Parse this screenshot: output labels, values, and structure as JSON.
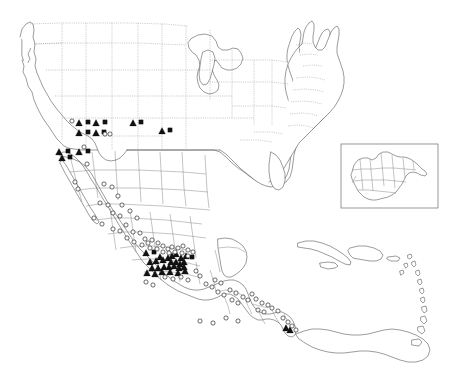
{
  "figure": {
    "kind": "distribution-map",
    "title": "",
    "projection_region": "North America, Mexico, Central America and the Caribbean",
    "background_color": "#ffffff",
    "coastline_color": "#4a4a4a",
    "internal_border_color": "#8d8d8d",
    "marker_fill_color": "#111111",
    "marker_open_color": "#ffffff"
  },
  "legend": {
    "visible": false,
    "entries": [
      {
        "symbol": "filled-triangle",
        "label": ""
      },
      {
        "symbol": "open-circle",
        "label": ""
      },
      {
        "symbol": "filled-square",
        "label": ""
      }
    ]
  },
  "inset": {
    "name": "guatemala-inset",
    "label": "",
    "frame": {
      "x": 341,
      "y": 144,
      "width": 97,
      "height": 64
    }
  },
  "chart_data": {
    "type": "scatter",
    "title": "",
    "xlabel": "",
    "ylabel": "",
    "grid": false,
    "legend_position": "none",
    "series": [
      {
        "name": "filled-triangle",
        "symbol": "filled-triangle",
        "count": 40,
        "points": [
          [
            79,
            123
          ],
          [
            96,
            123
          ],
          [
            133,
            123
          ],
          [
            79,
            133
          ],
          [
            96,
            133
          ],
          [
            162,
            131
          ],
          [
            59,
            152
          ],
          [
            79,
            152
          ],
          [
            62,
            158
          ],
          [
            146,
            253
          ],
          [
            160,
            257
          ],
          [
            150,
            262
          ],
          [
            156,
            261
          ],
          [
            163,
            260
          ],
          [
            168,
            258
          ],
          [
            172,
            256
          ],
          [
            176,
            254
          ],
          [
            171,
            262
          ],
          [
            176,
            262
          ],
          [
            181,
            258
          ],
          [
            180,
            264
          ],
          [
            184,
            262
          ],
          [
            186,
            256
          ],
          [
            152,
            268
          ],
          [
            158,
            268
          ],
          [
            164,
            267
          ],
          [
            169,
            267
          ],
          [
            174,
            266
          ],
          [
            179,
            268
          ],
          [
            184,
            267
          ],
          [
            147,
            273
          ],
          [
            155,
            274
          ],
          [
            162,
            272
          ],
          [
            170,
            272
          ],
          [
            178,
            273
          ],
          [
            185,
            271
          ],
          [
            286,
            328
          ],
          [
            290,
            330
          ],
          [
            358,
            188
          ],
          [
            371,
            188
          ]
        ]
      },
      {
        "name": "filled-square",
        "symbol": "filled-square",
        "count": 12,
        "points": [
          [
            88,
            122
          ],
          [
            105,
            122
          ],
          [
            141,
            122
          ],
          [
            88,
            132
          ],
          [
            104,
            132
          ],
          [
            170,
            130
          ],
          [
            68,
            151
          ],
          [
            88,
            151
          ],
          [
            70,
            157
          ],
          [
            154,
            252
          ],
          [
            192,
            257
          ],
          [
            377,
            187
          ]
        ]
      },
      {
        "name": "open-circle",
        "symbol": "open-circle",
        "count": 86,
        "points": [
          [
            72,
            121
          ],
          [
            105,
            134
          ],
          [
            110,
            134
          ],
          [
            84,
            147
          ],
          [
            87,
            164
          ],
          [
            75,
            182
          ],
          [
            78,
            189
          ],
          [
            104,
            184
          ],
          [
            112,
            187
          ],
          [
            118,
            196
          ],
          [
            100,
            203
          ],
          [
            108,
            205
          ],
          [
            122,
            205
          ],
          [
            113,
            213
          ],
          [
            120,
            216
          ],
          [
            130,
            211
          ],
          [
            137,
            218
          ],
          [
            94,
            218
          ],
          [
            102,
            224
          ],
          [
            113,
            229
          ],
          [
            120,
            231
          ],
          [
            126,
            225
          ],
          [
            133,
            232
          ],
          [
            127,
            238
          ],
          [
            134,
            242
          ],
          [
            140,
            233
          ],
          [
            145,
            239
          ],
          [
            142,
            245
          ],
          [
            148,
            243
          ],
          [
            152,
            240
          ],
          [
            158,
            243
          ],
          [
            150,
            248
          ],
          [
            157,
            249
          ],
          [
            163,
            246
          ],
          [
            168,
            249
          ],
          [
            172,
            247
          ],
          [
            178,
            248
          ],
          [
            183,
            246
          ],
          [
            188,
            250
          ],
          [
            163,
            252
          ],
          [
            169,
            253
          ],
          [
            175,
            252
          ],
          [
            182,
            253
          ],
          [
            188,
            256
          ],
          [
            193,
            252
          ],
          [
            165,
            277
          ],
          [
            173,
            279
          ],
          [
            181,
            277
          ],
          [
            188,
            280
          ],
          [
            196,
            271
          ],
          [
            200,
            276
          ],
          [
            146,
            282
          ],
          [
            153,
            285
          ],
          [
            206,
            284
          ],
          [
            212,
            287
          ],
          [
            215,
            280
          ],
          [
            221,
            283
          ],
          [
            218,
            292
          ],
          [
            224,
            295
          ],
          [
            230,
            290
          ],
          [
            236,
            293
          ],
          [
            232,
            300
          ],
          [
            238,
            303
          ],
          [
            243,
            297
          ],
          [
            248,
            300
          ],
          [
            252,
            294
          ],
          [
            256,
            299
          ],
          [
            262,
            303
          ],
          [
            268,
            305
          ],
          [
            258,
            310
          ],
          [
            264,
            312
          ],
          [
            272,
            308
          ],
          [
            278,
            311
          ],
          [
            283,
            318
          ],
          [
            288,
            322
          ],
          [
            292,
            326
          ],
          [
            296,
            330
          ],
          [
            200,
            321
          ],
          [
            213,
            323
          ],
          [
            226,
            318
          ],
          [
            238,
            321
          ],
          [
            365,
            187
          ],
          [
            372,
            190
          ],
          [
            383,
            172
          ],
          [
            377,
            196
          ],
          [
            379,
            202
          ],
          [
            386,
            192
          ]
        ]
      }
    ]
  },
  "regions": {
    "primary_map": "North America and Caribbean outline with US state and Mexican state boundaries",
    "inset_map": "Guatemala with departmental boundaries"
  }
}
